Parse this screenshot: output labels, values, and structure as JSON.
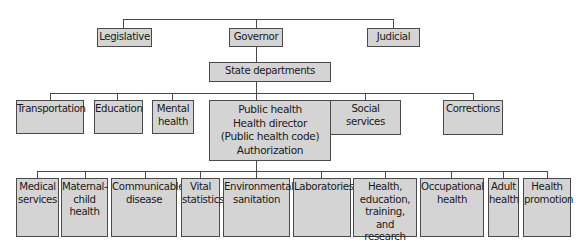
{
  "diagram": {
    "type": "org-chart",
    "branches": {
      "legislative": "Legislative",
      "governor": "Governor",
      "judicial": "Judicial"
    },
    "state_departments": "State departments",
    "departments": {
      "transportation": "Transportation",
      "education": "Education",
      "mental_health": "Mental\nhealth",
      "public_health": "Public health\nHealth director\n(Public health code)\nAuthorization",
      "social_services": "Social services",
      "corrections": "Corrections"
    },
    "public_health_divisions": {
      "medical_services": "Medical\nservices",
      "maternal_child_health": "Maternal-\nchild\nhealth",
      "communicable_disease": "Communicable\ndisease",
      "vital_statistics": "Vital\nstatistics",
      "environmental_sanitation": "Environmental\nsanitation",
      "laboratories": "Laboratories",
      "health_education": "Health,\neducation,\ntraining,\nand research",
      "occupational_health": "Occupational\nhealth",
      "adult_health": "Adult\nhealth",
      "health_promotion": "Health\npromotion"
    },
    "colors": {
      "box_fill": "#d4d4d4",
      "box_border": "#4a4a4a",
      "connector": "#4a4a4a",
      "text": "#1a1a1a"
    }
  }
}
